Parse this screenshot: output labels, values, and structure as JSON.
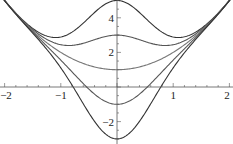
{
  "chart_data": {
    "type": "line",
    "title": "",
    "xlabel": "",
    "ylabel": "",
    "xlim": [
      -2,
      2
    ],
    "ylim": [
      -3.1,
      5.0
    ],
    "grid": false,
    "legend": null,
    "x_ticks": [
      {
        "value": -2,
        "label": "-2"
      },
      {
        "value": -1,
        "label": "-1"
      },
      {
        "value": 1,
        "label": "1"
      },
      {
        "value": 2,
        "label": "2"
      }
    ],
    "y_ticks": [
      {
        "value": -2,
        "label": "-2"
      },
      {
        "value": 2,
        "label": "2"
      },
      {
        "value": 4,
        "label": "4"
      }
    ],
    "x": [
      -2,
      -1.5,
      -1,
      -0.5,
      0,
      0.5,
      1,
      1.5,
      2
    ],
    "series": [
      {
        "name": "curve 1 (top)",
        "color": "#333333",
        "values": [
          5.0,
          3.38,
          2.89,
          4.03,
          5.0,
          4.03,
          2.89,
          3.38,
          5.0
        ]
      },
      {
        "name": "curve 2",
        "color": "#555555",
        "values": [
          5.0,
          3.29,
          2.45,
          2.69,
          3.0,
          2.69,
          2.45,
          3.29,
          5.0
        ]
      },
      {
        "name": "curve 3",
        "color": "#777777",
        "values": [
          5.0,
          3.25,
          2.0,
          1.25,
          1.0,
          1.25,
          2.0,
          3.25,
          5.0
        ]
      },
      {
        "name": "curve 4",
        "color": "#555555",
        "values": [
          5.0,
          3.21,
          1.55,
          -0.19,
          -1.0,
          -0.19,
          1.55,
          3.21,
          5.0
        ]
      },
      {
        "name": "curve 5 (bottom)",
        "color": "#333333",
        "values": [
          5.0,
          3.12,
          1.11,
          -1.53,
          -3.0,
          -1.53,
          1.11,
          3.12,
          5.0
        ]
      }
    ],
    "model": {
      "formula": "x^2 + 1 + k*exp(-1.5*x^2)",
      "k": [
        4,
        2,
        0,
        -2,
        -4
      ]
    }
  }
}
